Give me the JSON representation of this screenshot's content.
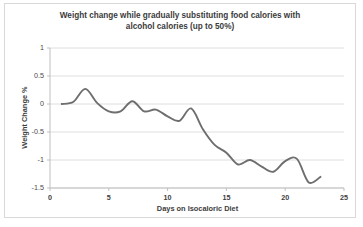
{
  "chart_data": {
    "type": "line",
    "title": "Weight change while gradually substituting food calories with alcohol calories (up to 50%)",
    "title_line1": "Weight change while gradually substituting food calories with",
    "title_line2": "alcohol calories (up to 50%)",
    "xlabel": "Days on Isocaloric Diet",
    "ylabel": "Weight Change %",
    "xlim": [
      0,
      25
    ],
    "ylim": [
      -1.5,
      1
    ],
    "xticks": [
      0,
      5,
      10,
      15,
      20,
      25
    ],
    "xtick_labels": [
      "0",
      "5",
      "10",
      "15",
      "20",
      "25"
    ],
    "yticks": [
      1,
      0.5,
      0,
      -0.5,
      -1,
      -1.5
    ],
    "ytick_labels": [
      "1",
      "0.5",
      "0",
      "-0.5",
      "-1",
      "-1.5"
    ],
    "grid": "horizontal",
    "legend": "none",
    "line_color": "#6e6e6e",
    "grid_color": "#d6d6d6",
    "axis_color": "#bfbfbf",
    "series": [
      {
        "name": "Weight change %",
        "x": [
          1,
          2,
          3,
          4,
          5,
          6,
          7,
          8,
          9,
          10,
          11,
          12,
          13,
          14,
          15,
          16,
          17,
          18,
          19,
          20,
          21,
          22,
          23
        ],
        "values": [
          0.0,
          0.04,
          0.27,
          0.02,
          -0.13,
          -0.13,
          0.05,
          -0.13,
          -0.1,
          -0.22,
          -0.3,
          -0.08,
          -0.45,
          -0.73,
          -0.87,
          -1.08,
          -1.0,
          -1.12,
          -1.21,
          -1.02,
          -0.98,
          -1.4,
          -1.3
        ]
      }
    ]
  }
}
